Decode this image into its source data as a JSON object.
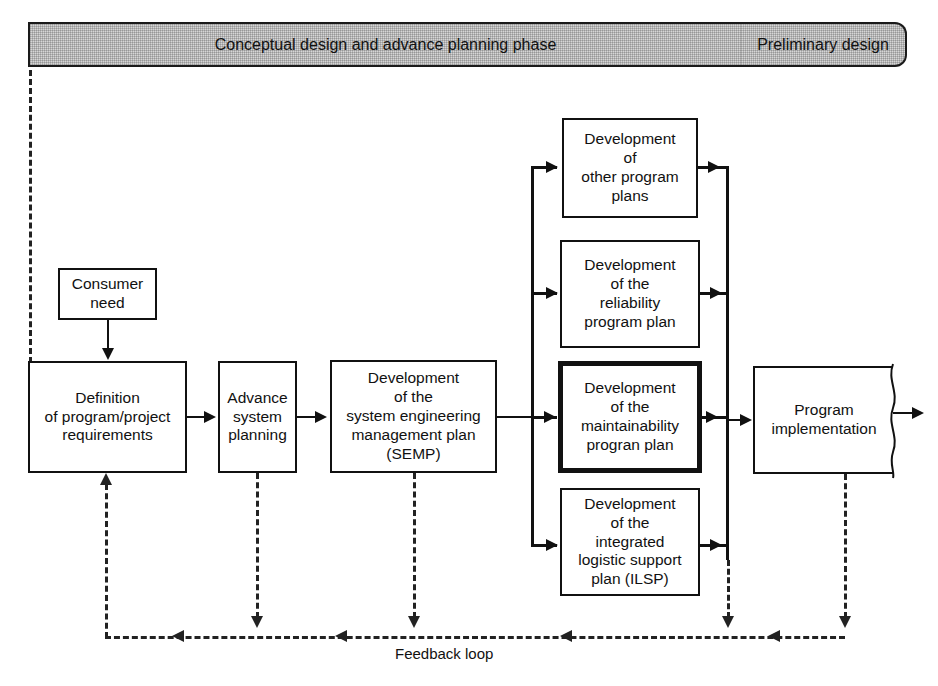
{
  "diagram": {
    "phases": [
      {
        "id": "conceptual",
        "label": "Conceptual design and advance planning phase"
      },
      {
        "id": "preliminary",
        "label": "Preliminary design"
      }
    ],
    "boxes": {
      "consumer_need": "Consumer\nneed",
      "definition": "Definition\nof program/project\nrequirements",
      "advance_planning": "Advance\nsystem\nplanning",
      "semp": "Development\nof the\nsystem engineering\nmanagement plan\n(SEMP)",
      "other_plans": "Development\nof\nother program\nplans",
      "reliability_plan": "Development\nof the\nreliability\nprogram plan",
      "maintainability_plan": "Development\nof the\nmaintainability\nprogran plan",
      "ilsp": "Development\nof the\nintegrated\nlogistic support\nplan (ILSP)",
      "program_implementation": "Program\nimplementation"
    },
    "labels": {
      "feedback_loop": "Feedback loop"
    },
    "colors": {
      "line": "#111111",
      "dashed_line": "#222222",
      "banner_fill": "#d6d6d6",
      "box_fill": "#ffffff",
      "highlight_border": "#000000"
    }
  }
}
